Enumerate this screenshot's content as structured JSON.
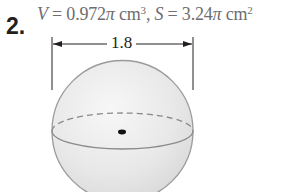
{
  "problem": {
    "number": "2.",
    "volume_var": "V",
    "volume_eq": " = 0.972",
    "pi": "π",
    "volume_unit": " cm",
    "volume_exp": "3",
    "separator": ", ",
    "surface_var": "S",
    "surface_eq": " = 3.24",
    "surface_unit": " cm",
    "surface_exp": "2"
  },
  "figure": {
    "shape": "sphere",
    "dimension_label": "1.8",
    "dimension_meaning": "diameter",
    "colors": {
      "sphere_fill": "#e4e4e4",
      "sphere_highlight": "#f7f7f7",
      "outline": "#9a9a9a",
      "equator": "#8a8a8a",
      "center_dot": "#111111",
      "dimension_lines": "#231f20"
    }
  }
}
